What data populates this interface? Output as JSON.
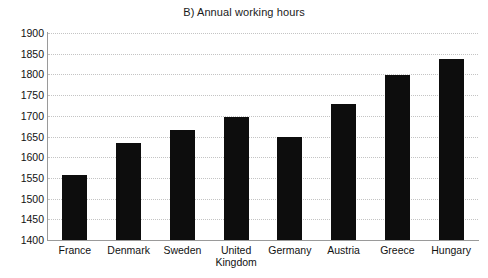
{
  "chart_data": {
    "type": "bar",
    "title": "B) Annual working hours",
    "subtitle": "",
    "xlabel": "",
    "ylabel": "",
    "categories": [
      "France",
      "Denmark",
      "Sweden",
      "United\nKingdom",
      "Germany",
      "Austria",
      "Greece",
      "Hungary"
    ],
    "values": [
      1558,
      1635,
      1665,
      1697,
      1650,
      1728,
      1798,
      1838
    ],
    "ylim": [
      1400,
      1900
    ],
    "yticks": [
      1400,
      1450,
      1500,
      1550,
      1600,
      1650,
      1700,
      1750,
      1800,
      1850,
      1900
    ],
    "ytick_labels": [
      "1400",
      "1450",
      "1500",
      "1550",
      "1600",
      "1650",
      "1700",
      "1750",
      "1800",
      "1850",
      "1900"
    ],
    "grid": true,
    "grid_axis": "y",
    "grid_style": "dotted",
    "legend": false,
    "legend_position": "none",
    "bar_color": "#0d0d0d",
    "grid_color": "#c4c4c4",
    "axis_color": "#9a9a9a",
    "background_color": "#ffffff",
    "text_color": "#111111"
  }
}
